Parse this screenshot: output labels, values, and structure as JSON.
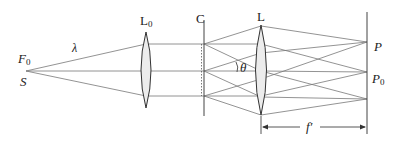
{
  "diagram": {
    "type": "optics-setup",
    "labels": {
      "source_focus": "F",
      "source_focus_sub": "0",
      "source": "S",
      "wavelength": "λ",
      "collimating_lens": "L",
      "collimating_lens_sub": "0",
      "screen_c": "C",
      "lens": "L",
      "angle": "θ",
      "point_p": "P",
      "point_p0": "P",
      "point_p0_sub": "0",
      "focal_length": "f′"
    },
    "colors": {
      "line": "#666666",
      "lens_fill": "#ebebeb",
      "text": "#222222"
    }
  }
}
